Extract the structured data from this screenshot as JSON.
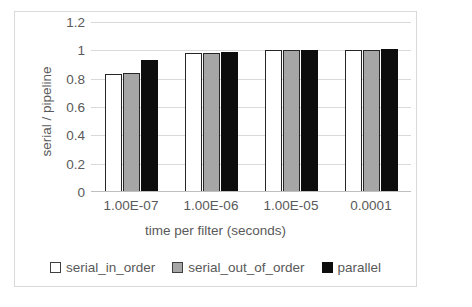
{
  "chart_data": {
    "type": "bar",
    "title": "",
    "subtitle": "",
    "xlabel": "time per filter (seconds)",
    "ylabel": "serial / pipeline",
    "categories": [
      "1.00E-07",
      "1.00E-06",
      "1.00E-05",
      "0.0001"
    ],
    "series": [
      {
        "name": "serial_in_order",
        "color": "#ffffff",
        "border_color": "#262626",
        "values": [
          0.83,
          0.98,
          1.0,
          1.0
        ]
      },
      {
        "name": "serial_out_of_order",
        "color": "#a6a6a6",
        "border_color": "#262626",
        "values": [
          0.84,
          0.98,
          1.0,
          1.0
        ]
      },
      {
        "name": "parallel",
        "color": "#0d0d0d",
        "border_color": "#0d0d0d",
        "values": [
          0.93,
          0.99,
          1.0,
          1.01
        ]
      }
    ],
    "ylim": [
      0,
      1.2
    ],
    "yticks": [
      0,
      0.2,
      0.4,
      0.6,
      0.8,
      1,
      1.2
    ],
    "ytick_labels": [
      "0",
      "0.2",
      "0.4",
      "0.6",
      "0.8",
      "1",
      "1.2"
    ],
    "grid": true,
    "grid_color": "#d9d9d9",
    "legend_position": "bottom",
    "legend_entries": [
      "serial_in_order",
      "serial_out_of_order",
      "parallel"
    ],
    "plot_background": "#ffffff",
    "text_color": "#595959",
    "frame_color": "#d9d9d9"
  }
}
